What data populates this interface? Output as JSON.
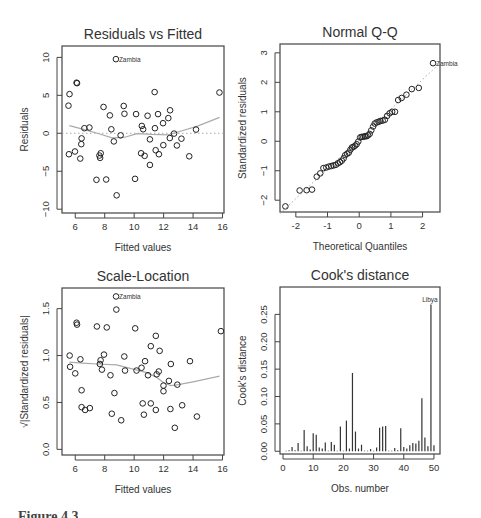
{
  "figure": {
    "caption_partial": "Figure 4.3"
  },
  "chart_data": [
    {
      "id": "residuals_vs_fitted",
      "type": "scatter",
      "title": "Residuals vs Fitted",
      "xlabel": "Fitted values",
      "ylabel": "Residuals",
      "xlim": [
        5.1,
        16.1
      ],
      "ylim": [
        -10.5,
        11.5
      ],
      "xticks": [
        6,
        8,
        10,
        12,
        14,
        16
      ],
      "yticks": [
        -10,
        -5,
        0,
        5,
        10
      ],
      "reference_line": {
        "y": 0,
        "style": "dotted"
      },
      "smoother": [
        [
          5.6,
          1.0
        ],
        [
          6.5,
          0.55
        ],
        [
          7.5,
          0.0
        ],
        [
          8.5,
          -0.6
        ],
        [
          9.3,
          -0.55
        ],
        [
          10.2,
          -0.05
        ],
        [
          11.2,
          -0.15
        ],
        [
          12.3,
          -0.2
        ],
        [
          13.2,
          0.3
        ],
        [
          14.3,
          0.95
        ],
        [
          15.8,
          2.1
        ]
      ],
      "labels": [
        {
          "text": "Zambia",
          "x": 8.76,
          "y": 9.77
        }
      ],
      "points": [
        [
          8.76,
          9.77
        ],
        [
          6.09,
          6.67
        ],
        [
          6.12,
          6.6
        ],
        [
          5.61,
          5.16
        ],
        [
          5.54,
          3.64
        ],
        [
          11.39,
          5.43
        ],
        [
          15.79,
          5.37
        ],
        [
          7.92,
          3.47
        ],
        [
          9.29,
          3.6
        ],
        [
          8.35,
          2.36
        ],
        [
          9.34,
          2.57
        ],
        [
          10.13,
          2.53
        ],
        [
          10.91,
          2.31
        ],
        [
          11.62,
          2.53
        ],
        [
          12.44,
          3.03
        ],
        [
          12.32,
          2.0
        ],
        [
          11.96,
          1.33
        ],
        [
          6.62,
          0.67
        ],
        [
          6.96,
          0.76
        ],
        [
          8.45,
          0.53
        ],
        [
          10.52,
          0.97
        ],
        [
          10.61,
          0.53
        ],
        [
          11.41,
          0.67
        ],
        [
          14.2,
          0.49
        ],
        [
          9.08,
          -0.27
        ],
        [
          6.43,
          -0.67
        ],
        [
          8.62,
          -1.07
        ],
        [
          11.07,
          -0.8
        ],
        [
          12.71,
          -0.04
        ],
        [
          12.42,
          -0.63
        ],
        [
          13.21,
          -0.71
        ],
        [
          6.41,
          -1.43
        ],
        [
          5.57,
          -2.76
        ],
        [
          5.98,
          -2.4
        ],
        [
          6.34,
          -3.33
        ],
        [
          7.73,
          -2.63
        ],
        [
          7.64,
          -2.93
        ],
        [
          7.69,
          -3.24
        ],
        [
          10.47,
          -2.63
        ],
        [
          10.71,
          -2.97
        ],
        [
          11.46,
          -2.23
        ],
        [
          11.68,
          -2.76
        ],
        [
          11.98,
          -1.56
        ],
        [
          12.9,
          -1.6
        ],
        [
          13.74,
          -3.03
        ],
        [
          11.07,
          -4.17
        ],
        [
          7.44,
          -6.13
        ],
        [
          8.1,
          -6.09
        ],
        [
          10.06,
          -6.0
        ],
        [
          8.81,
          -8.17
        ]
      ],
      "box": {
        "left": 62,
        "top": 46,
        "right": 224,
        "bottom": 213
      }
    },
    {
      "id": "normal_qq",
      "type": "scatter",
      "title": "Normal Q-Q",
      "xlabel": "Theoretical Quantiles",
      "ylabel": "Standardized residuals",
      "xlim": [
        -2.5,
        2.55
      ],
      "ylim": [
        -2.4,
        3.3
      ],
      "xticks": [
        -2,
        -1,
        0,
        1,
        2
      ],
      "yticks": [
        -2,
        -1,
        0,
        1,
        2,
        3
      ],
      "reference_line": {
        "from": [
          -2.5,
          -2.45
        ],
        "to": [
          2.55,
          2.65
        ],
        "style": "dotted"
      },
      "labels": [
        {
          "text": "Zambia",
          "x": 2.33,
          "y": 2.65
        }
      ],
      "points": [
        [
          -2.33,
          -2.21
        ],
        [
          -1.88,
          -1.67
        ],
        [
          -1.66,
          -1.66
        ],
        [
          -1.49,
          -1.64
        ],
        [
          -1.34,
          -1.2
        ],
        [
          -1.23,
          -1.09
        ],
        [
          -1.13,
          -0.91
        ],
        [
          -1.04,
          -0.89
        ],
        [
          -0.96,
          -0.86
        ],
        [
          -0.88,
          -0.84
        ],
        [
          -0.81,
          -0.82
        ],
        [
          -0.74,
          -0.8
        ],
        [
          -0.67,
          -0.75
        ],
        [
          -0.61,
          -0.71
        ],
        [
          -0.55,
          -0.66
        ],
        [
          -0.49,
          -0.58
        ],
        [
          -0.44,
          -0.47
        ],
        [
          -0.38,
          -0.42
        ],
        [
          -0.33,
          -0.39
        ],
        [
          -0.28,
          -0.29
        ],
        [
          -0.23,
          -0.21
        ],
        [
          -0.18,
          -0.19
        ],
        [
          -0.13,
          -0.15
        ],
        [
          -0.08,
          -0.1
        ],
        [
          -0.03,
          -0.01
        ],
        [
          0.03,
          0.13
        ],
        [
          0.08,
          0.15
        ],
        [
          0.13,
          0.15
        ],
        [
          0.18,
          0.17
        ],
        [
          0.23,
          0.17
        ],
        [
          0.28,
          0.2
        ],
        [
          0.33,
          0.25
        ],
        [
          0.38,
          0.37
        ],
        [
          0.44,
          0.5
        ],
        [
          0.49,
          0.6
        ],
        [
          0.55,
          0.64
        ],
        [
          0.61,
          0.66
        ],
        [
          0.67,
          0.69
        ],
        [
          0.74,
          0.7
        ],
        [
          0.81,
          0.73
        ],
        [
          0.88,
          0.86
        ],
        [
          0.96,
          0.95
        ],
        [
          1.04,
          1.0
        ],
        [
          1.13,
          1.0
        ],
        [
          1.23,
          1.4
        ],
        [
          1.34,
          1.47
        ],
        [
          1.49,
          1.58
        ],
        [
          1.66,
          1.77
        ],
        [
          1.88,
          1.81
        ],
        [
          2.33,
          2.65
        ]
      ],
      "box": {
        "left": 280,
        "top": 44,
        "right": 440,
        "bottom": 212
      }
    },
    {
      "id": "scale_location",
      "type": "scatter",
      "title": "Scale-Location",
      "xlabel": "Fitted values",
      "ylabel": "√|Standardized residuals|",
      "xlim": [
        5.1,
        16.1
      ],
      "ylim": [
        -0.06,
        1.72
      ],
      "xticks": [
        6,
        8,
        10,
        12,
        14,
        16
      ],
      "yticks": [
        0.0,
        0.5,
        1.0,
        1.5
      ],
      "ytick_labels": [
        "0.0",
        "0.5",
        "1.0",
        "1.5"
      ],
      "smoother": [
        [
          5.6,
          0.93
        ],
        [
          6.5,
          0.92
        ],
        [
          7.5,
          0.91
        ],
        [
          8.8,
          0.9
        ],
        [
          9.8,
          0.86
        ],
        [
          10.8,
          0.82
        ],
        [
          11.5,
          0.77
        ],
        [
          12.0,
          0.71
        ],
        [
          12.5,
          0.68
        ],
        [
          13.0,
          0.69
        ],
        [
          14.0,
          0.72
        ],
        [
          15.8,
          0.78
        ]
      ],
      "labels": [
        {
          "text": "Zambia",
          "x": 8.77,
          "y": 1.63
        }
      ],
      "points": [
        [
          8.77,
          1.63
        ],
        [
          8.79,
          1.49
        ],
        [
          6.09,
          1.35
        ],
        [
          6.12,
          1.33
        ],
        [
          7.47,
          1.31
        ],
        [
          8.14,
          1.3
        ],
        [
          10.07,
          1.29
        ],
        [
          15.89,
          1.26
        ],
        [
          11.47,
          1.21
        ],
        [
          11.13,
          1.1
        ],
        [
          11.73,
          1.05
        ],
        [
          5.62,
          1.0
        ],
        [
          7.95,
          1.01
        ],
        [
          9.33,
          0.99
        ],
        [
          6.35,
          0.96
        ],
        [
          7.72,
          0.95
        ],
        [
          10.74,
          0.94
        ],
        [
          13.79,
          0.94
        ],
        [
          7.67,
          0.91
        ],
        [
          12.49,
          0.91
        ],
        [
          5.65,
          0.88
        ],
        [
          7.81,
          0.85
        ],
        [
          9.38,
          0.84
        ],
        [
          10.16,
          0.84
        ],
        [
          10.5,
          0.87
        ],
        [
          11.67,
          0.83
        ],
        [
          6.0,
          0.81
        ],
        [
          8.39,
          0.79
        ],
        [
          10.94,
          0.79
        ],
        [
          11.53,
          0.8
        ],
        [
          12.36,
          0.73
        ],
        [
          11.99,
          0.68
        ],
        [
          12.93,
          0.69
        ],
        [
          6.43,
          0.63
        ],
        [
          11.99,
          0.62
        ],
        [
          8.66,
          0.6
        ],
        [
          10.58,
          0.49
        ],
        [
          11.13,
          0.49
        ],
        [
          13.26,
          0.47
        ],
        [
          6.43,
          0.45
        ],
        [
          6.67,
          0.42
        ],
        [
          6.99,
          0.44
        ],
        [
          11.47,
          0.42
        ],
        [
          12.46,
          0.43
        ],
        [
          8.48,
          0.38
        ],
        [
          10.66,
          0.37
        ],
        [
          14.26,
          0.35
        ],
        [
          9.12,
          0.31
        ],
        [
          12.76,
          0.23
        ]
      ],
      "box": {
        "left": 62,
        "top": 288,
        "right": 224,
        "bottom": 455
      }
    },
    {
      "id": "cooks_distance",
      "type": "bar",
      "title": "Cook's distance",
      "xlabel": "Obs. number",
      "ylabel": "Cook's distance",
      "xlim": [
        -1,
        52
      ],
      "ylim": [
        -0.005,
        0.3
      ],
      "xticks": [
        0,
        10,
        20,
        30,
        40,
        50
      ],
      "yticks": [
        0.0,
        0.05,
        0.1,
        0.15,
        0.2,
        0.25
      ],
      "ytick_labels": [
        "0.00",
        "0.05",
        "0.10",
        "0.15",
        "0.20",
        "0.25"
      ],
      "labels": [
        {
          "text": "Libya",
          "x": 49,
          "y": 0.268
        }
      ],
      "categories": [
        1,
        2,
        3,
        4,
        5,
        6,
        7,
        8,
        9,
        10,
        11,
        12,
        13,
        14,
        15,
        16,
        17,
        18,
        19,
        20,
        21,
        22,
        23,
        24,
        25,
        26,
        27,
        28,
        29,
        30,
        31,
        32,
        33,
        34,
        35,
        36,
        37,
        38,
        39,
        40,
        41,
        42,
        43,
        44,
        45,
        46,
        47,
        48,
        49,
        50
      ],
      "values": [
        0.001,
        0.002,
        0.008,
        0.002,
        0.015,
        0.001,
        0.039,
        0.009,
        0.003,
        0.033,
        0.03,
        0.007,
        0.005,
        0.016,
        0.001,
        0.017,
        0.012,
        0.001,
        0.045,
        0.001,
        0.056,
        0.005,
        0.143,
        0.036,
        0.005,
        0.012,
        0.001,
        0.001,
        0.004,
        0.001,
        0.007,
        0.043,
        0.045,
        0.046,
        0.001,
        0.001,
        0.006,
        0.002,
        0.042,
        0.008,
        0.005,
        0.011,
        0.015,
        0.014,
        0.019,
        0.097,
        0.025,
        0.009,
        0.268,
        0.011
      ],
      "box": {
        "left": 280,
        "top": 287,
        "right": 440,
        "bottom": 454
      }
    }
  ]
}
